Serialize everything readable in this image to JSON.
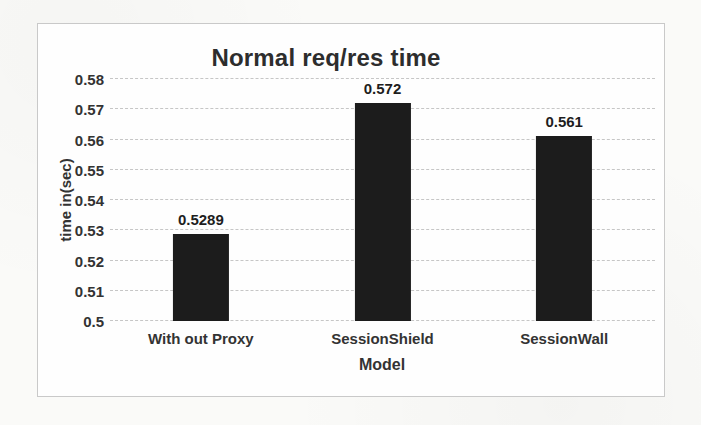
{
  "colors": {
    "bar": "#1c1c1c",
    "gridline": "#c6c6c6",
    "text": "#2f2f2f",
    "chart_border": "#c9c9c9",
    "page_background": "#fafaf8",
    "chart_background": "#fefefe"
  },
  "chart_data": {
    "type": "bar",
    "title": "Normal req/res time",
    "xlabel": "Model",
    "ylabel": "time in(sec)",
    "categories": [
      "With out Proxy",
      "SessionShield",
      "SessionWall"
    ],
    "values": [
      0.5289,
      0.572,
      0.561
    ],
    "labels": [
      "0.5289",
      "0.572",
      "0.561"
    ],
    "ylim": [
      0.5,
      0.58
    ],
    "yticks": [
      "0.5",
      "0.51",
      "0.52",
      "0.53",
      "0.54",
      "0.55",
      "0.56",
      "0.57",
      "0.58"
    ],
    "grid": true,
    "legend": false
  }
}
